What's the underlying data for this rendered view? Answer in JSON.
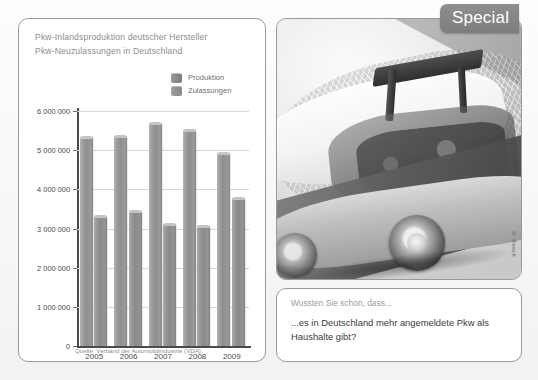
{
  "special_badge": {
    "label": "Special"
  },
  "chart_panel": {
    "title_line1": "Pkw-Inlandsproduktion deutscher Hersteller",
    "title_line2": "Pkw-Neuzulassungen in Deutschland",
    "source": "Quelle: Verband der Automobilindustrie (VDA)"
  },
  "photo_panel": {
    "credit": "© Bosch",
    "alt": "transparent-car-cutaway-photo"
  },
  "fact_panel": {
    "kicker": "Wussten Sie schon, dass...",
    "text": "...es in Deutschland mehr angemeldete Pkw als Haushalte gibt?"
  },
  "chart_data": {
    "type": "bar",
    "xlabel": "",
    "ylabel": "",
    "categories": [
      "2005",
      "2006",
      "2007",
      "2008",
      "2009"
    ],
    "series": [
      {
        "name": "Produktion",
        "values": [
          5350000,
          5400000,
          5710000,
          5530000,
          4960000
        ]
      },
      {
        "name": "Zulassungen",
        "values": [
          3340000,
          3470000,
          3150000,
          3090000,
          3810000
        ]
      }
    ],
    "ylim": [
      0,
      6000000
    ],
    "ytick_labels": [
      "0",
      "1 000 000",
      "2 000 000",
      "3 000 000",
      "4 000 000",
      "5 000 000",
      "6 000 000"
    ],
    "ytick_values": [
      0,
      1000000,
      2000000,
      3000000,
      4000000,
      5000000,
      6000000
    ],
    "grid": true,
    "legend_position": "top-right",
    "legend": [
      "Produktion",
      "Zulassungen"
    ],
    "source": "Quelle: Verband der Automobilindustrie (VDA)",
    "colors": {
      "produktion": "#8e8e8e",
      "zulassungen": "#8a8a8a",
      "grid": "#d7d7d7",
      "axis": "#4a4a4a"
    }
  }
}
